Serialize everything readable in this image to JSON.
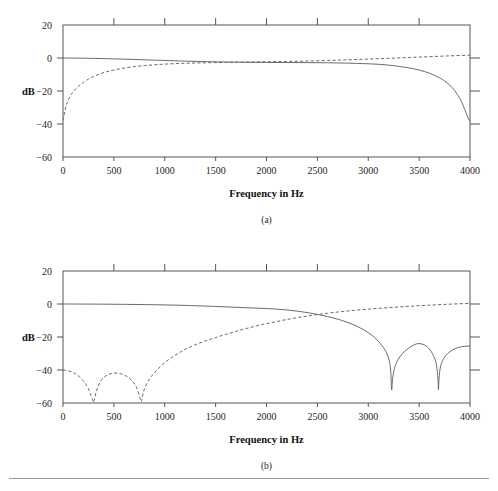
{
  "figure": {
    "background_color": "#ffffff",
    "line_color": "#5a5a5a",
    "axis_color": "#555555",
    "rule_color": "#9a9a9a"
  },
  "panels": [
    {
      "id": "a",
      "caption": "(a)",
      "ylabel": "dB",
      "xlabel": "Frequency in Hz"
    },
    {
      "id": "b",
      "caption": "(b)",
      "ylabel": "dB",
      "xlabel": "Frequency in Hz"
    }
  ],
  "chart_data": [
    {
      "type": "line",
      "title": "",
      "subtitle": "(a)",
      "xlabel": "Frequency in Hz",
      "ylabel": "dB",
      "xlim": [
        0,
        4000
      ],
      "ylim": [
        -60,
        20
      ],
      "xticks": [
        0,
        500,
        1000,
        1500,
        2000,
        2500,
        3000,
        3500,
        4000
      ],
      "xticklabels": [
        "0",
        "500",
        "1000",
        "1500",
        "2000",
        "2500",
        "3000",
        "3500",
        "4000"
      ],
      "yticks": [
        20,
        0,
        -20,
        -40,
        -60
      ],
      "yticklabels": [
        "20",
        "0",
        "-20",
        "-40",
        "-60"
      ],
      "right_axis_ticks": [
        0,
        -20,
        -40
      ],
      "grid": false,
      "legend": null,
      "series": [
        {
          "name": "lowpass-solid",
          "style": "solid",
          "x": [
            0,
            100,
            200,
            300,
            400,
            500,
            600,
            700,
            800,
            900,
            1000,
            1200,
            1400,
            1600,
            1800,
            2000,
            2200,
            2400,
            2600,
            2800,
            3000,
            3200,
            3400,
            3500,
            3600,
            3700,
            3750,
            3800,
            3850,
            3900,
            3930,
            3960,
            3980,
            3995,
            4000
          ],
          "y": [
            0.0,
            -0.05,
            -0.12,
            -0.22,
            -0.35,
            -0.52,
            -0.7,
            -0.9,
            -1.1,
            -1.3,
            -1.5,
            -1.9,
            -2.2,
            -2.45,
            -2.6,
            -2.7,
            -2.75,
            -2.8,
            -2.9,
            -3.1,
            -3.5,
            -4.3,
            -6.0,
            -7.3,
            -9.2,
            -12.0,
            -13.9,
            -16.4,
            -19.8,
            -24.5,
            -28.4,
            -33.0,
            -36.2,
            -38.0,
            -38.3
          ]
        },
        {
          "name": "highpass-dashed",
          "style": "dashed",
          "x": [
            0,
            20,
            40,
            60,
            80,
            100,
            130,
            160,
            200,
            250,
            300,
            360,
            420,
            500,
            600,
            700,
            800,
            900,
            1000,
            1200,
            1400,
            1600,
            1800,
            2000,
            2200,
            2400,
            2600,
            2800,
            3000,
            3200,
            3400,
            3600,
            3800,
            4000
          ],
          "y": [
            -38.0,
            -31.8,
            -27.2,
            -24.4,
            -22.2,
            -20.5,
            -18.4,
            -16.7,
            -14.8,
            -12.8,
            -11.2,
            -9.7,
            -8.5,
            -7.3,
            -6.1,
            -5.2,
            -4.6,
            -4.1,
            -3.7,
            -3.2,
            -2.9,
            -2.65,
            -2.45,
            -2.3,
            -2.1,
            -1.85,
            -1.5,
            -1.1,
            -0.65,
            -0.2,
            0.3,
            0.8,
            1.3,
            1.7
          ]
        }
      ]
    },
    {
      "type": "line",
      "title": "",
      "subtitle": "(b)",
      "xlabel": "Frequency in Hz",
      "ylabel": "dB",
      "xlim": [
        0,
        4000
      ],
      "ylim": [
        -60,
        20
      ],
      "xticks": [
        0,
        500,
        1000,
        1500,
        2000,
        2500,
        3000,
        3500,
        4000
      ],
      "xticklabels": [
        "0",
        "500",
        "1000",
        "1500",
        "2000",
        "2500",
        "3000",
        "3500",
        "4000"
      ],
      "yticks": [
        20,
        0,
        -20,
        -40,
        -60
      ],
      "yticklabels": [
        "20",
        "0",
        "-20",
        "-40",
        "-60"
      ],
      "right_axis_ticks": [
        0,
        -20,
        -40
      ],
      "grid": false,
      "legend": null,
      "notes": {
        "solid_nulls_hz": [
          3230,
          3690
        ],
        "solid_sidelobe_peaks_db": [
          -38.5,
          -38.0
        ],
        "dashed_nulls_hz": [
          300,
          770
        ],
        "dashed_sidelobe_peaks_db": [
          -40.0,
          -42.0
        ]
      },
      "series": [
        {
          "name": "lowpass-solid",
          "style": "solid",
          "x": [
            0,
            200,
            400,
            600,
            800,
            1000,
            1200,
            1400,
            1500,
            1600,
            1700,
            1800,
            1900,
            2000,
            2100,
            2200,
            2300,
            2400,
            2500,
            2600,
            2700,
            2800,
            2900,
            3000,
            3060,
            3110,
            3150,
            3180,
            3205,
            3220,
            3230,
            3240,
            3260,
            3290,
            3330,
            3380,
            3430,
            3460,
            3490,
            3530,
            3570,
            3610,
            3650,
            3672,
            3685,
            3690,
            3696,
            3710,
            3740,
            3780,
            3830,
            3880,
            3930,
            3970,
            4000
          ],
          "y": [
            0.0,
            -0.04,
            -0.1,
            -0.2,
            -0.35,
            -0.55,
            -0.85,
            -1.25,
            -1.5,
            -1.75,
            -2.0,
            -2.25,
            -2.5,
            -2.75,
            -3.1,
            -3.6,
            -4.3,
            -5.2,
            -6.3,
            -7.6,
            -9.2,
            -11.2,
            -13.8,
            -17.4,
            -20.2,
            -23.4,
            -26.5,
            -29.6,
            -34.0,
            -40.0,
            -52.0,
            -45.0,
            -38.5,
            -34.0,
            -30.5,
            -27.5,
            -25.5,
            -24.5,
            -24.0,
            -24.3,
            -25.5,
            -28.0,
            -32.5,
            -37.5,
            -45.5,
            -52.0,
            -45.0,
            -38.0,
            -33.2,
            -30.0,
            -27.8,
            -26.5,
            -25.8,
            -25.5,
            -25.4
          ]
        },
        {
          "name": "highpass-dashed",
          "style": "dashed",
          "x": [
            0,
            40,
            80,
            120,
            160,
            200,
            230,
            255,
            275,
            290,
            300,
            310,
            325,
            345,
            375,
            410,
            450,
            490,
            520,
            560,
            600,
            640,
            680,
            710,
            735,
            755,
            768,
            775,
            785,
            800,
            830,
            870,
            920,
            980,
            1050,
            1120,
            1200,
            1300,
            1400,
            1500,
            1600,
            1700,
            1800,
            1900,
            2000,
            2200,
            2400,
            2600,
            2800,
            3000,
            3200,
            3400,
            3600,
            3800,
            4000
          ],
          "y": [
            -40.0,
            -40.3,
            -41.0,
            -42.2,
            -44.0,
            -46.6,
            -49.2,
            -52.2,
            -55.5,
            -58.0,
            -59.6,
            -57.5,
            -53.5,
            -50.0,
            -46.2,
            -44.0,
            -42.6,
            -42.0,
            -41.9,
            -42.2,
            -43.0,
            -44.4,
            -46.6,
            -49.0,
            -52.5,
            -56.5,
            -59.2,
            -58.0,
            -55.0,
            -51.5,
            -47.5,
            -43.8,
            -40.2,
            -36.6,
            -33.2,
            -30.4,
            -27.5,
            -24.7,
            -22.4,
            -20.3,
            -18.4,
            -16.6,
            -14.9,
            -13.3,
            -11.9,
            -9.4,
            -7.3,
            -5.6,
            -4.2,
            -3.1,
            -2.2,
            -1.4,
            -0.7,
            -0.1,
            0.4
          ]
        }
      ]
    }
  ]
}
